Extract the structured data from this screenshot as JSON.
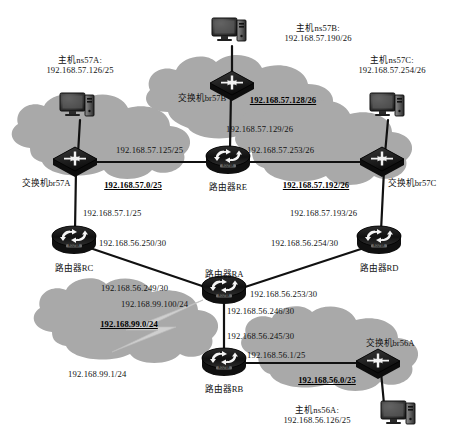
{
  "diagram": {
    "colors": {
      "background": "#ffffff",
      "cloud_fill": "#a9a9a9",
      "device_dark": "#141414",
      "device_mid": "#3a3a3a",
      "link": "#111111",
      "text": "#111111"
    }
  },
  "clouds": [
    {
      "id": "net57A",
      "subnet": "192.168.57.0/25",
      "label_x": 133,
      "label_y": 186
    },
    {
      "id": "net57B",
      "subnet": "192.168.57.128/26",
      "label_x": 283,
      "label_y": 101
    },
    {
      "id": "net57C",
      "subnet": "192.168.57.192/26",
      "label_x": 316,
      "label_y": 186
    },
    {
      "id": "net99",
      "subnet": "192.168.99.0/24",
      "label_x": 129,
      "label_y": 325
    },
    {
      "id": "net56A",
      "subnet": "192.168.56.0/25",
      "label_x": 327,
      "label_y": 381
    }
  ],
  "devices": [
    {
      "id": "host-ns57A",
      "type": "host",
      "name": "主机ns57A:",
      "ip": "192.168.57.126/25",
      "x": 80,
      "y": 106
    },
    {
      "id": "host-ns57B",
      "type": "host",
      "name": "主机ns57B:",
      "ip": "192.168.57.190/26",
      "x": 232,
      "y": 31
    },
    {
      "id": "host-ns57C",
      "type": "host",
      "name": "主机ns57C:",
      "ip": "192.168.57.254/26",
      "x": 392,
      "y": 106
    },
    {
      "id": "host-ns56A",
      "type": "host",
      "name": "主机ns56A:",
      "ip": "192.168.56.126/25",
      "x": 403,
      "y": 414
    },
    {
      "id": "sw-br57A",
      "type": "switch",
      "name": "交换机br57A",
      "x": 75,
      "y": 158
    },
    {
      "id": "sw-br57B",
      "type": "switch",
      "name": "交换机br57B",
      "x": 232,
      "y": 82
    },
    {
      "id": "sw-br57C",
      "type": "switch",
      "name": "交换机br57C",
      "x": 382,
      "y": 158
    },
    {
      "id": "sw-br56A",
      "type": "switch",
      "name": "交换机br56A",
      "x": 378,
      "y": 360
    },
    {
      "id": "rt-RE",
      "type": "router",
      "name": "路由器RE",
      "x": 228,
      "y": 160
    },
    {
      "id": "rt-RC",
      "type": "router",
      "name": "路由器RC",
      "x": 74,
      "y": 240
    },
    {
      "id": "rt-RD",
      "type": "router",
      "name": "路由器RD",
      "x": 379,
      "y": 240
    },
    {
      "id": "rt-RA",
      "type": "router",
      "name": "路由器RA",
      "x": 224,
      "y": 290
    },
    {
      "id": "rt-RB",
      "type": "router",
      "name": "路由器RB",
      "x": 224,
      "y": 362
    }
  ],
  "device_labels": [
    {
      "for": "host-ns57A",
      "lines": [
        "主机ns57A:",
        "192.168.57.126/25"
      ],
      "x": 80,
      "y": 58,
      "align": "center"
    },
    {
      "for": "host-ns57B",
      "lines": [
        "主机ns57B:",
        "192.168.57.190/26"
      ],
      "x": 318,
      "y": 5,
      "align": "center"
    },
    {
      "for": "host-ns57C",
      "lines": [
        "主机ns57C:",
        "192.168.57.254/26"
      ],
      "x": 392,
      "y": 58,
      "align": "center"
    },
    {
      "for": "host-ns56A",
      "lines": [
        "主机ns56A:",
        "192.168.56.126/25"
      ],
      "x": 316,
      "y": 406,
      "align": "center"
    },
    {
      "for": "sw-br57A",
      "lines": [
        "交换机br57A"
      ],
      "x": 46,
      "y": 177,
      "align": "center"
    },
    {
      "for": "sw-br57B",
      "lines": [
        "交换机br57B"
      ],
      "x": 201,
      "y": 93,
      "align": "center"
    },
    {
      "for": "sw-br57C",
      "lines": [
        "交换机br57C"
      ],
      "x": 413,
      "y": 177,
      "align": "center"
    },
    {
      "for": "sw-br56A",
      "lines": [
        "交换机br56A"
      ],
      "x": 390,
      "y": 338,
      "align": "center"
    },
    {
      "for": "rt-RE",
      "lines": [
        "路由器RE"
      ],
      "x": 228,
      "y": 181,
      "align": "center"
    },
    {
      "for": "rt-RC",
      "lines": [
        "路由器RC"
      ],
      "x": 74,
      "y": 262,
      "align": "center"
    },
    {
      "for": "rt-RD",
      "lines": [
        "路由器RD"
      ],
      "x": 379,
      "y": 262,
      "align": "center"
    },
    {
      "for": "rt-RA",
      "lines": [
        "路由器RA"
      ],
      "x": 224,
      "y": 268,
      "align": "center"
    },
    {
      "for": "rt-RB",
      "lines": [
        "路由器RB"
      ],
      "x": 224,
      "y": 383,
      "align": "center"
    }
  ],
  "interface_labels": [
    {
      "id": "if-57-125",
      "text": "192.168.57.125/25",
      "x": 116,
      "y": 148,
      "align": "left"
    },
    {
      "id": "if-57-129",
      "text": "192.168.57.129/26",
      "x": 232,
      "y": 126,
      "align": "left"
    },
    {
      "id": "if-57-253",
      "text": "192.168.57.253/26",
      "x": 248,
      "y": 148,
      "align": "left"
    },
    {
      "id": "if-57-1",
      "text": "192.168.57.1/25",
      "x": 83,
      "y": 211,
      "align": "left"
    },
    {
      "id": "if-57-193",
      "text": "192.168.57.193/26",
      "x": 293,
      "y": 211,
      "align": "left"
    },
    {
      "id": "if-56-250",
      "text": "192.168.56.250/30",
      "x": 100,
      "y": 240,
      "align": "left"
    },
    {
      "id": "if-56-254",
      "text": "192.168.56.254/30",
      "x": 272,
      "y": 240,
      "align": "left"
    },
    {
      "id": "if-56-249",
      "text": "192.168.56.249/30",
      "x": 101,
      "y": 286,
      "align": "left"
    },
    {
      "id": "if-56-253",
      "text": "192.168.56.253/30",
      "x": 252,
      "y": 292,
      "align": "left"
    },
    {
      "id": "if-99-100",
      "text": "192.168.99.100/24",
      "x": 122,
      "y": 302,
      "align": "left"
    },
    {
      "id": "if-56-246",
      "text": "192.168.56.246/30",
      "x": 229,
      "y": 309,
      "align": "left"
    },
    {
      "id": "if-56-245",
      "text": "192.168.56.245/30",
      "x": 229,
      "y": 334,
      "align": "left"
    },
    {
      "id": "if-56-1",
      "text": "192.168.56.1/25",
      "x": 248,
      "y": 353,
      "align": "left"
    },
    {
      "id": "if-99-1",
      "text": "192.168.99.1/24",
      "x": 69,
      "y": 372,
      "align": "left"
    }
  ],
  "links": [
    {
      "from": "host-ns57A",
      "to": "sw-br57A",
      "x1": 80,
      "y1": 120,
      "x2": 78,
      "y2": 152
    },
    {
      "from": "host-ns57B",
      "to": "sw-br57B",
      "x1": 232,
      "y1": 46,
      "x2": 232,
      "y2": 76
    },
    {
      "from": "host-ns57C",
      "to": "sw-br57C",
      "x1": 388,
      "y1": 120,
      "x2": 385,
      "y2": 152
    },
    {
      "from": "sw-br57A",
      "to": "rt-RE",
      "x1": 90,
      "y1": 162,
      "x2": 212,
      "y2": 162
    },
    {
      "from": "sw-br57B",
      "to": "rt-RE",
      "x1": 230,
      "y1": 94,
      "x2": 229,
      "y2": 150
    },
    {
      "from": "rt-RE",
      "to": "sw-br57C",
      "x1": 246,
      "y1": 162,
      "x2": 368,
      "y2": 162
    },
    {
      "from": "sw-br57A",
      "to": "rt-RC",
      "x1": 76,
      "y1": 170,
      "x2": 75,
      "y2": 231
    },
    {
      "from": "sw-br57C",
      "to": "rt-RD",
      "x1": 383,
      "y1": 170,
      "x2": 381,
      "y2": 231
    },
    {
      "from": "rt-RC",
      "to": "rt-RA",
      "x1": 88,
      "y1": 248,
      "x2": 209,
      "y2": 289
    },
    {
      "from": "rt-RD",
      "to": "rt-RA",
      "x1": 366,
      "y1": 248,
      "x2": 241,
      "y2": 289
    },
    {
      "from": "rt-RA",
      "to": "rt-RB",
      "x1": 224,
      "y1": 302,
      "x2": 224,
      "y2": 352
    },
    {
      "from": "rt-RB",
      "to": "sw-br56A",
      "x1": 241,
      "y1": 363,
      "x2": 365,
      "y2": 363
    },
    {
      "from": "sw-br56A",
      "to": "host-ns56A",
      "x1": 381,
      "y1": 372,
      "x2": 383,
      "y2": 404
    }
  ]
}
